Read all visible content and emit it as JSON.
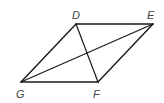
{
  "diagram": {
    "type": "parallelogram",
    "vertices": [
      {
        "label": "D",
        "x": 76,
        "y": 24,
        "label_x": 72,
        "label_y": 19
      },
      {
        "label": "E",
        "x": 153,
        "y": 24,
        "label_x": 147,
        "label_y": 19
      },
      {
        "label": "F",
        "x": 98,
        "y": 82,
        "label_x": 93,
        "label_y": 98
      },
      {
        "label": "G",
        "x": 21,
        "y": 82,
        "label_x": 16,
        "label_y": 98
      }
    ],
    "sides": [
      "DE",
      "EF",
      "FG",
      "GD"
    ],
    "diagonals": [
      "DF",
      "GE"
    ],
    "colors": {
      "line": "#1a1a1a",
      "label": "#444444",
      "background": "#ffffff"
    }
  }
}
